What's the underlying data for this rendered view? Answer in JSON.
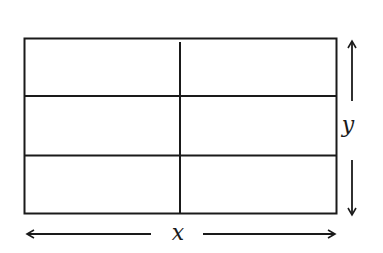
{
  "diagram": {
    "rectangle": {
      "x": 24,
      "y": 38,
      "width": 312,
      "height": 175
    },
    "grid": {
      "columns": 2,
      "rows": 3
    },
    "dividers": {
      "vertical_x": 180,
      "horizontal_y": [
        96,
        155
      ]
    },
    "labels": {
      "width_label": "x",
      "height_label": "y"
    },
    "colors": {
      "stroke": "#1a1a1a",
      "background": "#ffffff"
    }
  }
}
